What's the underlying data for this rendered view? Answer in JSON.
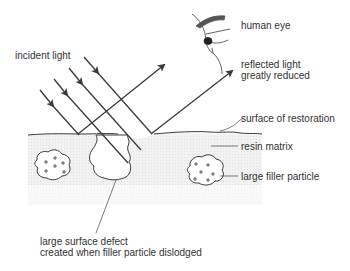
{
  "diagram": {
    "labels": {
      "incident_light": "incident light",
      "human_eye": "human eye",
      "reflected_line1": "reflected light",
      "reflected_line2": "greatly reduced",
      "surface": "surface of restoration",
      "resin": "resin matrix",
      "filler": "large filler particle",
      "defect_line1": "large surface defect",
      "defect_line2": "created when filler particle dislodged"
    },
    "colors": {
      "line": "#3a3a3a",
      "text": "#333333",
      "matrix_fill": "#eeeeee",
      "eyebrow": "#555555"
    }
  }
}
